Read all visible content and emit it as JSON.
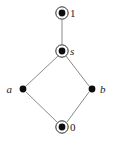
{
  "diagram": {
    "type": "hasse-lattice-diagram",
    "background_color": "#ffffff",
    "edge_color": "#8a8a8a",
    "node_fill_color": "#0d0d0d",
    "node_ring_color": "#2b2b2b",
    "label_color": "#1a1a1a",
    "nodes": [
      {
        "id": "one",
        "label": "1",
        "style": "double-circle",
        "label_style": "upright",
        "label_position": "right",
        "cx": 62,
        "cy": 13,
        "dot_r": 3.4,
        "ring_r": 6.2,
        "label_x": 70,
        "label_y": 17
      },
      {
        "id": "s",
        "label": "s",
        "style": "double-circle",
        "label_style": "italic",
        "label_position": "right",
        "cx": 62,
        "cy": 51,
        "dot_r": 3.4,
        "ring_r": 6.2,
        "label_x": 70,
        "label_y": 55
      },
      {
        "id": "a",
        "label": "a",
        "style": "dot",
        "label_style": "italic",
        "label_position": "left",
        "cx": 23,
        "cy": 89,
        "dot_r": 3.4,
        "ring_r": 0,
        "label_x": 12,
        "label_y": 93
      },
      {
        "id": "b",
        "label": "b",
        "style": "dot",
        "label_style": "italic",
        "label_position": "right",
        "cx": 92,
        "cy": 89,
        "dot_r": 3.4,
        "ring_r": 0,
        "label_x": 100,
        "label_y": 93
      },
      {
        "id": "zero",
        "label": "0",
        "style": "double-circle",
        "label_style": "upright",
        "label_position": "right",
        "cx": 62,
        "cy": 127,
        "dot_r": 3.4,
        "ring_r": 6.2,
        "label_x": 70,
        "label_y": 131
      }
    ],
    "edges": [
      {
        "id": "one-s",
        "from": "one",
        "to": "s",
        "x1": 62,
        "y1": 20,
        "x2": 62,
        "y2": 44
      },
      {
        "id": "s-a",
        "from": "s",
        "to": "a",
        "x1": 58,
        "y1": 56,
        "x2": 26,
        "y2": 86
      },
      {
        "id": "s-b",
        "from": "s",
        "to": "b",
        "x1": 66,
        "y1": 56,
        "x2": 89,
        "y2": 86
      },
      {
        "id": "a-zero",
        "from": "a",
        "to": "zero",
        "x1": 26,
        "y1": 92,
        "x2": 57,
        "y2": 122
      },
      {
        "id": "b-zero",
        "from": "b",
        "to": "zero",
        "x1": 89,
        "y1": 92,
        "x2": 67,
        "y2": 122
      }
    ]
  }
}
